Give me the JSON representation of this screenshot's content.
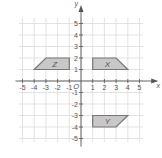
{
  "diagram": {
    "type": "coordinate-grid",
    "axes": {
      "x_label": "x",
      "y_label": "y",
      "origin_label": "O",
      "x_range": [
        -5,
        5
      ],
      "y_range": [
        -5,
        5
      ],
      "x_ticks": [
        "-5",
        "-4",
        "-3",
        "-2",
        "-1",
        "1",
        "2",
        "3",
        "4",
        "5"
      ],
      "y_ticks": [
        "5",
        "4",
        "3",
        "2",
        "1",
        "-1",
        "-2",
        "-3",
        "-4",
        "-5"
      ]
    },
    "shapes": [
      {
        "label": "Z",
        "vertices": [
          [
            -4,
            1
          ],
          [
            -3,
            2
          ],
          [
            -1,
            2
          ],
          [
            -1,
            1
          ]
        ]
      },
      {
        "label": "X",
        "vertices": [
          [
            1,
            1
          ],
          [
            1,
            2
          ],
          [
            3,
            2
          ],
          [
            4,
            1
          ]
        ]
      },
      {
        "label": "Y",
        "vertices": [
          [
            1,
            -3
          ],
          [
            4,
            -3
          ],
          [
            3,
            -4
          ],
          [
            1,
            -4
          ]
        ]
      }
    ],
    "colors": {
      "grid": "#dcdcdc",
      "axis": "#555555",
      "shape_fill": "#c8c8c8",
      "shape_stroke": "#777777"
    }
  }
}
